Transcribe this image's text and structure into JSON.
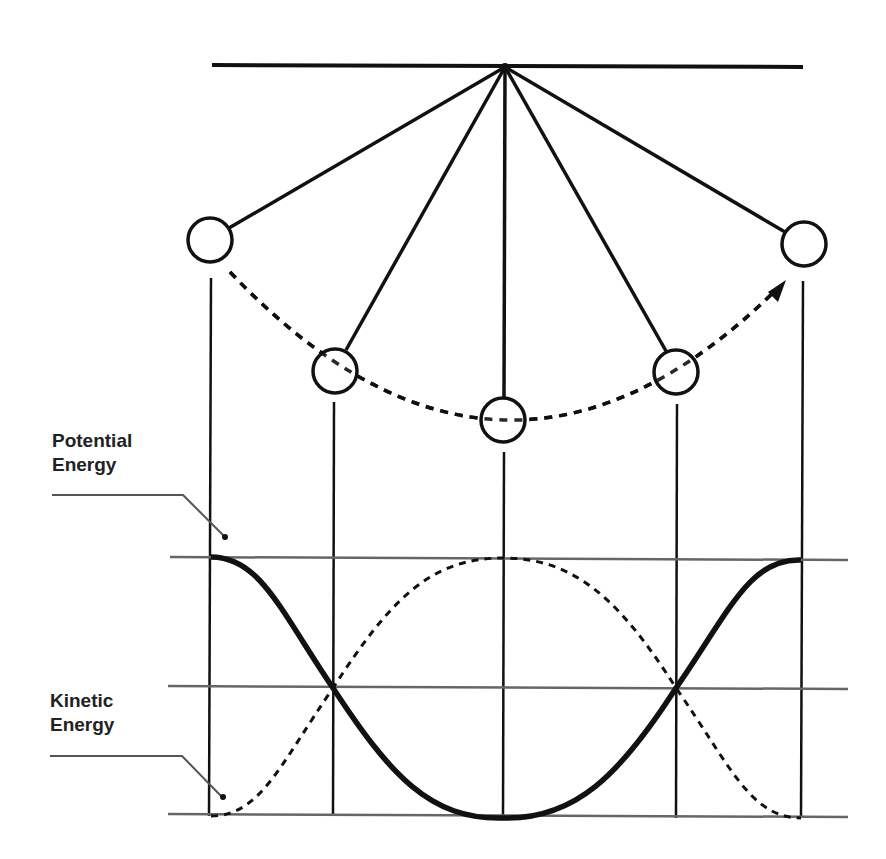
{
  "diagram": {
    "labels": {
      "potential": "Potential\nEnergy",
      "kinetic": "Kinetic\nEnergy"
    },
    "colors": {
      "ink": "#111111",
      "grid": "#666666",
      "background": "#ffffff"
    },
    "pivot": {
      "x": 505,
      "y": 67
    },
    "support_bar": {
      "x1": 212,
      "x2": 803,
      "y": 66
    },
    "bobs": [
      {
        "name": "bob-far-left",
        "x": 210,
        "y": 240
      },
      {
        "name": "bob-mid-left",
        "x": 335,
        "y": 371
      },
      {
        "name": "bob-center",
        "x": 503,
        "y": 420
      },
      {
        "name": "bob-mid-right",
        "x": 676,
        "y": 372
      },
      {
        "name": "bob-far-right",
        "x": 804,
        "y": 244
      }
    ],
    "energy_levels": {
      "max_y": 558,
      "half_y": 688,
      "zero_y": 816
    },
    "curves": [
      {
        "name": "potential-energy-curve",
        "style": "solid"
      },
      {
        "name": "kinetic-energy-curve",
        "style": "dashed"
      }
    ]
  }
}
